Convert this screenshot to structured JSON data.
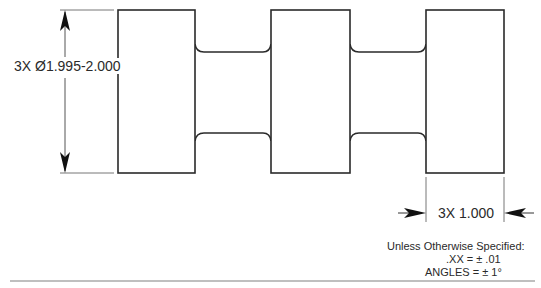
{
  "drawing": {
    "diameter_dim": "3X Ø1.995-2.000",
    "width_dim": "3X 1.000",
    "notes": {
      "line1": "Unless Otherwise Specified:",
      "line2": ".XX = ± .01",
      "line3": "ANGLES = ± 1°"
    },
    "colors": {
      "line": "#2a2a2a",
      "dim_line": "#555555",
      "background": "#ffffff"
    }
  }
}
